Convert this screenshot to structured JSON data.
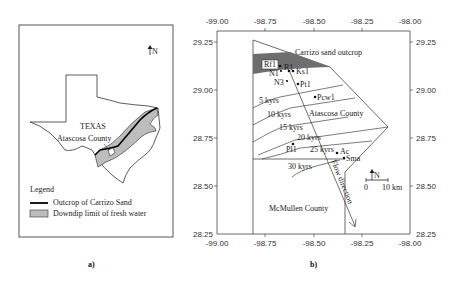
{
  "panel_a": {
    "caption": "a)",
    "state_label": "TEXAS",
    "county_label": "Atascosa County",
    "north_label": "N",
    "legend": {
      "title": "Legend",
      "items": [
        {
          "label": "Outcrop of Carrizo Sand",
          "symbol": "thick-black-line",
          "color": "#000000"
        },
        {
          "label": "Downdip limit of fresh water",
          "symbol": "gray-box",
          "color": "#bdbdbd"
        }
      ]
    }
  },
  "panel_b": {
    "caption": "b)",
    "x_ticks": [
      "-99.00",
      "-98.75",
      "-98.50",
      "-98.25",
      "-98.00"
    ],
    "y_ticks": [
      "29.25",
      "29.00",
      "28.75",
      "28.50",
      "28.25"
    ],
    "outcrop_label": "Carrizo sand outcrop",
    "outcrop_color": "#6e6e6e",
    "county_labels": {
      "atascosa": "Atascosa County",
      "mcmullen": "McMullen County"
    },
    "isochrons": [
      "5 kyrs",
      "10 kyrs",
      "15 kyrs",
      "20 kyrs",
      "25 kyrs",
      "30 kyrs"
    ],
    "wells": [
      "Rf1",
      "R1",
      "Ks1",
      "N1",
      "N3",
      "Pt1",
      "Pcw1",
      "Pl1",
      "Ac",
      "Sma"
    ],
    "flow_label": "Flow direction",
    "north_label": "N",
    "scale_bar": {
      "start": "0",
      "end": "10 km"
    }
  }
}
